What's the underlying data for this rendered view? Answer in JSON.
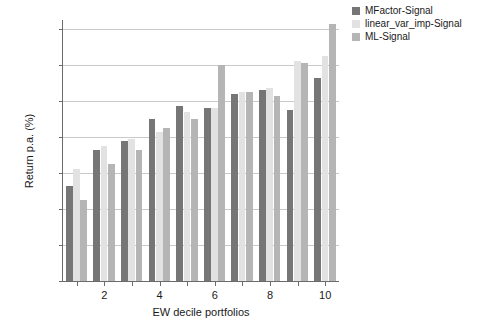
{
  "chart_data": {
    "type": "bar",
    "title": "",
    "xlabel": "EW decile portfolios",
    "ylabel": "Return p.a. (%)",
    "categories": [
      "1",
      "2",
      "3",
      "4",
      "5",
      "6",
      "7",
      "8",
      "9",
      "10"
    ],
    "xtick_labels": [
      "2",
      "4",
      "6",
      "8",
      "10"
    ],
    "xtick_categories": [
      "2",
      "4",
      "6",
      "8",
      "10"
    ],
    "ytick_labels": [
      "0",
      "0.02",
      "0.04",
      "0.06",
      "0.08",
      "0.1",
      "0.12",
      "0.14"
    ],
    "ytick_values": [
      0,
      0.02,
      0.04,
      0.06,
      0.08,
      0.1,
      0.12,
      0.14
    ],
    "ylim": [
      0,
      0.145
    ],
    "grid": true,
    "grid_axis": "y",
    "legend_position": "top-right",
    "series": [
      {
        "name": "MFactor-Signal",
        "color": "#767676",
        "values": [
          0.053,
          0.073,
          0.078,
          0.09,
          0.097,
          0.096,
          0.104,
          0.106,
          0.095,
          0.113
        ]
      },
      {
        "name": "linear_var_imp-Signal",
        "color": "#e2e2e2",
        "values": [
          0.062,
          0.075,
          0.079,
          0.083,
          0.094,
          0.096,
          0.105,
          0.107,
          0.122,
          0.125
        ]
      },
      {
        "name": "ML-Signal",
        "color": "#b5b5b5",
        "values": [
          0.045,
          0.065,
          0.073,
          0.085,
          0.09,
          0.12,
          0.105,
          0.103,
          0.121,
          0.143
        ]
      }
    ]
  },
  "legend": {
    "items": [
      {
        "label": "MFactor-Signal",
        "color": "#767676"
      },
      {
        "label": "linear_var_imp-Signal",
        "color": "#e2e2e2"
      },
      {
        "label": "ML-Signal",
        "color": "#b5b5b5"
      }
    ]
  },
  "axes": {
    "y_label": "Return p.a. (%)",
    "x_label": "EW decile portfolios"
  }
}
